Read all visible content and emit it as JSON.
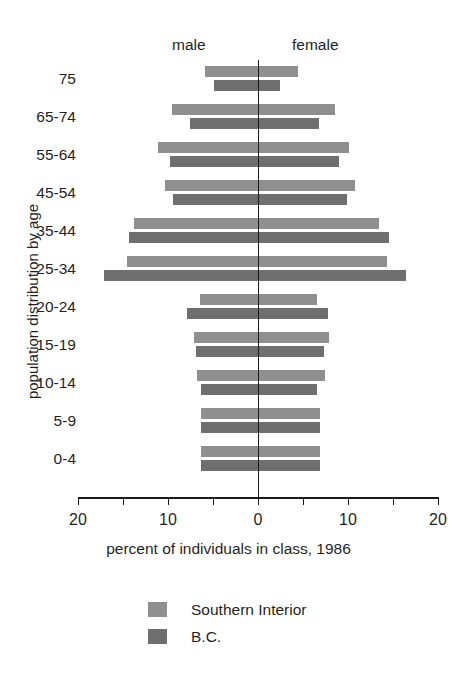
{
  "top_fragment": "",
  "chart_data": {
    "type": "bar",
    "title": "",
    "subtitle": "",
    "xlabel": "percent of individuals in class, 1986",
    "ylabel": "population distribution by age",
    "orientation": "population-pyramid",
    "grid": false,
    "legend_position": "bottom",
    "xlim": [
      -20,
      20
    ],
    "xticks": [
      20,
      10,
      0,
      10,
      20
    ],
    "xtick_labels": [
      "20",
      "10",
      "0",
      "10",
      "20"
    ],
    "side_labels": {
      "left": "male",
      "right": "female"
    },
    "categories": [
      "75",
      "65-74",
      "55-64",
      "45-54",
      "35-44",
      "25-34",
      "20-24",
      "15-19",
      "10-14",
      "5-9",
      "0-4"
    ],
    "series": [
      {
        "name": "Southern Interior",
        "color": "#8f8f8f",
        "male": [
          5.9,
          9.6,
          11.1,
          10.3,
          13.8,
          14.6,
          6.5,
          7.1,
          6.8,
          6.3,
          6.3
        ],
        "female": [
          4.4,
          8.6,
          10.1,
          10.8,
          13.4,
          14.3,
          6.5,
          7.9,
          7.4,
          6.9,
          6.9
        ]
      },
      {
        "name": "B.C.",
        "color": "#6f6f6f",
        "male": [
          4.9,
          7.6,
          9.8,
          9.4,
          14.3,
          17.1,
          7.9,
          6.9,
          6.3,
          6.3,
          6.3
        ],
        "female": [
          2.5,
          6.8,
          9.0,
          9.9,
          14.6,
          16.5,
          7.8,
          7.3,
          6.6,
          6.9,
          6.9
        ]
      }
    ]
  },
  "legend": {
    "items": [
      {
        "label": "Southern Interior",
        "color": "#8f8f8f"
      },
      {
        "label": "B.C.",
        "color": "#6f6f6f"
      }
    ]
  }
}
